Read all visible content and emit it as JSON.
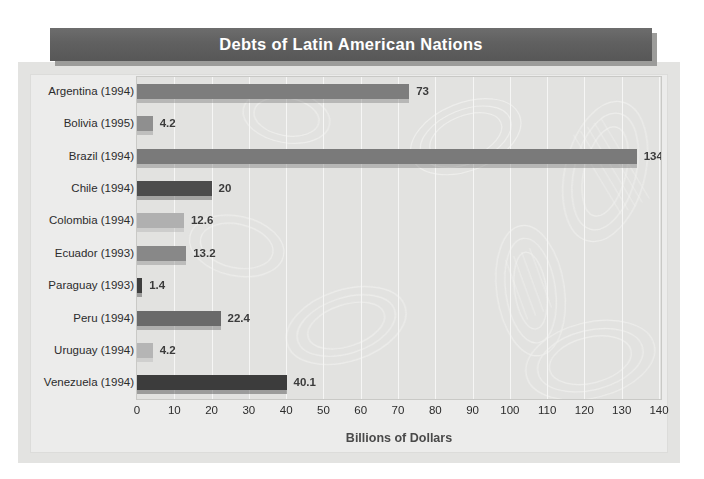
{
  "title": "Debts of Latin American Nations",
  "colors": {
    "title_banner": "#636363",
    "title_text": "#ffffff",
    "page_background": "#ffffff",
    "frame_background": "#e3e3e1",
    "plot_background": "#e2e2e0",
    "gridline": "#f6f6f5",
    "label_text": "#2b2b2b",
    "data_label_text": "#3b3b3b",
    "axis_title_text": "#4a4a4a"
  },
  "axis": {
    "title": "Billions of Dollars",
    "ticks": [
      "0",
      "10",
      "20",
      "30",
      "40",
      "50",
      "60",
      "70",
      "80",
      "90",
      "100",
      "110",
      "120",
      "130",
      "140"
    ]
  },
  "chart_data": {
    "type": "bar",
    "orientation": "horizontal",
    "title": "Debts of Latin American Nations",
    "xlabel": "Billions of Dollars",
    "ylabel": "",
    "xlim": [
      0,
      140
    ],
    "xticks": [
      0,
      10,
      20,
      30,
      40,
      50,
      60,
      70,
      80,
      90,
      100,
      110,
      120,
      130,
      140
    ],
    "grid": true,
    "grid_axis": "x",
    "legend": false,
    "categories": [
      "Argentina (1994)",
      "Bolivia (1995)",
      "Brazil (1994)",
      "Chile (1994)",
      "Colombia (1994)",
      "Ecuador (1993)",
      "Paraguay (1993)",
      "Peru (1994)",
      "Uruguay (1994)",
      "Venezuela (1994)"
    ],
    "values": [
      73,
      4.2,
      134,
      20,
      12.6,
      13.2,
      1.4,
      22.4,
      4.2,
      40.1
    ],
    "value_labels": [
      "73",
      "4.2",
      "134",
      "20",
      "12.6",
      "13.2",
      "1.4",
      "22.4",
      "4.2",
      "40.1"
    ],
    "bar_colors": [
      "#7d7d7d",
      "#8f8f8f",
      "#7a7a7a",
      "#4c4c4c",
      "#b0b0b0",
      "#888888",
      "#3e3e3e",
      "#6a6a6a",
      "#b5b5b5",
      "#3c3c3c"
    ],
    "bars": [
      {
        "category": "Argentina (1994)",
        "value": 73,
        "label": "73",
        "color": "#7d7d7d"
      },
      {
        "category": "Bolivia (1995)",
        "value": 4.2,
        "label": "4.2",
        "color": "#8f8f8f"
      },
      {
        "category": "Brazil (1994)",
        "value": 134,
        "label": "134",
        "color": "#7a7a7a"
      },
      {
        "category": "Chile (1994)",
        "value": 20,
        "label": "20",
        "color": "#4c4c4c"
      },
      {
        "category": "Colombia (1994)",
        "value": 12.6,
        "label": "12.6",
        "color": "#b0b0b0"
      },
      {
        "category": "Ecuador (1993)",
        "value": 13.2,
        "label": "13.2",
        "color": "#888888"
      },
      {
        "category": "Paraguay (1993)",
        "value": 1.4,
        "label": "1.4",
        "color": "#3e3e3e"
      },
      {
        "category": "Peru (1994)",
        "value": 22.4,
        "label": "22.4",
        "color": "#6a6a6a"
      },
      {
        "category": "Uruguay (1994)",
        "value": 4.2,
        "label": "4.2",
        "color": "#b5b5b5"
      },
      {
        "category": "Venezuela (1994)",
        "value": 40.1,
        "label": "40.1",
        "color": "#3c3c3c"
      }
    ]
  }
}
